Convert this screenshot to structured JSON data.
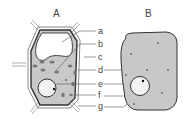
{
  "diagram": {
    "cell_a": {
      "title": "A",
      "type": "plant cell"
    },
    "cell_b": {
      "title": "B",
      "type": "animal cell"
    },
    "labels": [
      "a",
      "b",
      "c",
      "d",
      "e",
      "f",
      "g"
    ],
    "colors": {
      "cytoplasm": "#c8c8c8",
      "outline": "#333333",
      "vacuole": "#ffffff",
      "nucleus": "#f2f2f2",
      "organelle": "#777777"
    }
  }
}
